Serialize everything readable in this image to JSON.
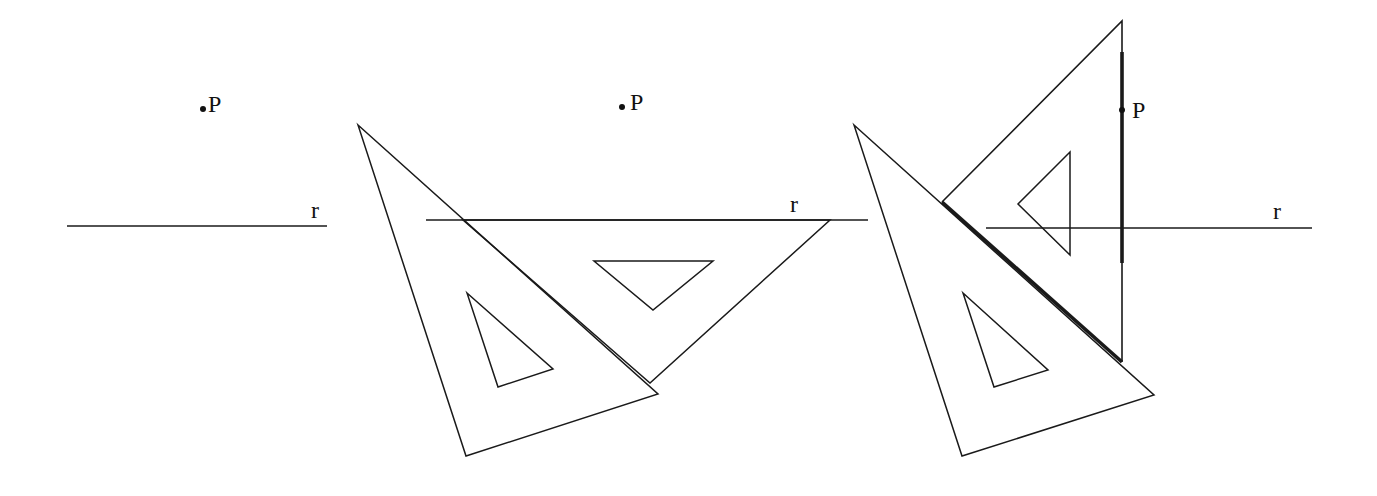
{
  "figure": {
    "panels": [
      {
        "id": "step-1",
        "point_label": "P",
        "line_label": "r"
      },
      {
        "id": "step-2",
        "point_label": "P",
        "line_label": "r"
      },
      {
        "id": "step-3",
        "point_label": "P",
        "line_label": "r"
      }
    ],
    "colors": {
      "stroke": "#1a1a1a",
      "background": "#ffffff"
    }
  }
}
